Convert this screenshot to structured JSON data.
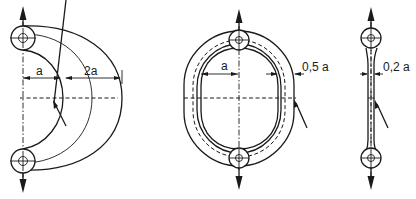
{
  "figures": [
    {
      "id": "c-shaped-link",
      "description": "C-shaped (open) link with eyes at both ends, loaded in tension",
      "dimensions": [
        {
          "label": "a",
          "meaning": "distance from load axis to inner edge"
        },
        {
          "label": "2a",
          "meaning": "width of curved section"
        }
      ]
    },
    {
      "id": "oval-ring-link",
      "description": "Closed oval ring link with eyes at top and bottom, loaded in tension",
      "dimensions": [
        {
          "label": "a",
          "meaning": "distance from load axis to inner edge"
        },
        {
          "label": "0,5 a",
          "meaning": "wall thickness of ring"
        }
      ]
    },
    {
      "id": "straight-bar-link",
      "description": "Straight slender bar with eyes at both ends, loaded in tension",
      "dimensions": [
        {
          "label": "0,2 a",
          "meaning": "bar thickness"
        }
      ]
    }
  ],
  "labels": {
    "fig1_a": "a",
    "fig1_2a": "2a",
    "fig2_a": "a",
    "fig2_05a": "0,5 a",
    "fig3_02a": "0,2 a"
  },
  "colors": {
    "line": "#1a1a1a",
    "background": "#ffffff"
  }
}
